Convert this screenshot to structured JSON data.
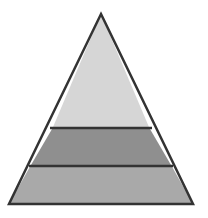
{
  "diagram": {
    "type": "pyramid",
    "levels": [
      {
        "name": "top",
        "label": "",
        "fill": "#d6d6d6"
      },
      {
        "name": "middle",
        "label": "",
        "fill": "#8f8f8f"
      },
      {
        "name": "bottom",
        "label": "",
        "fill": "#a9a9a9"
      }
    ],
    "stroke": "#333333",
    "background": "#ffffff"
  }
}
